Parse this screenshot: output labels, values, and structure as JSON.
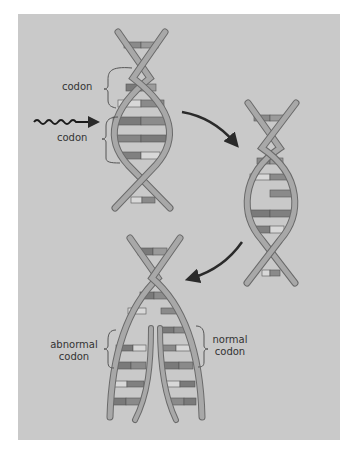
{
  "figure": {
    "background": "#c9c9c9",
    "strand_color": "#a8a8a8",
    "strand_outline": "#6a6a6a",
    "rung_dark": "#7a7a7a",
    "rung_mid": "#969696",
    "rung_light": "#d8d8d8",
    "arrow_color": "#2a2a2a"
  },
  "labels": {
    "codon_top": "codon",
    "codon_bottom": "codon",
    "abnormal_line1": "abnormal",
    "abnormal_line2": "codon",
    "normal_line1": "normal",
    "normal_line2": "codon"
  },
  "elements": {
    "wavy_arrow": "radiation-wave-arrow",
    "arrow_1": "curved-arrow-right-down",
    "arrow_2": "curved-arrow-left-down"
  }
}
